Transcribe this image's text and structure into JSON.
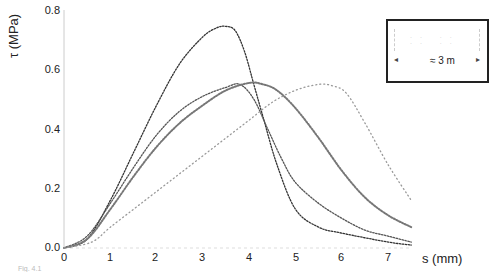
{
  "chart_data": {
    "type": "scatter",
    "title": "",
    "xlabel": "s (mm)",
    "ylabel": "τ (MPa)",
    "xlim": [
      0,
      7.5
    ],
    "ylim": [
      0,
      0.8
    ],
    "x_ticks": [
      "0",
      "1",
      "2",
      "3",
      "4",
      "5",
      "6",
      "7"
    ],
    "y_ticks": [
      "0.0",
      "0.2",
      "0.4",
      "0.6",
      "0.8"
    ],
    "grid": false,
    "legend_position": "inset top-right",
    "inset_label": "≈ 3 m",
    "series": [
      {
        "name": "Curve A (highest peak)",
        "x": [
          0,
          0.5,
          1.0,
          1.5,
          2.0,
          2.5,
          3.0,
          3.3,
          3.5,
          3.7,
          3.9,
          4.1,
          4.3,
          4.6,
          5.0,
          5.5,
          6.0,
          7.0,
          7.5
        ],
        "y": [
          0,
          0.03,
          0.16,
          0.32,
          0.48,
          0.62,
          0.71,
          0.74,
          0.745,
          0.73,
          0.66,
          0.55,
          0.44,
          0.28,
          0.13,
          0.07,
          0.05,
          0.02,
          0.01
        ]
      },
      {
        "name": "Curve B",
        "x": [
          0,
          0.5,
          1.0,
          1.5,
          2.0,
          2.5,
          3.0,
          3.5,
          3.8,
          4.1,
          4.4,
          4.7,
          5.0,
          5.5,
          6.0,
          6.5,
          7.0,
          7.5
        ],
        "y": [
          0,
          0.04,
          0.15,
          0.27,
          0.38,
          0.46,
          0.51,
          0.54,
          0.55,
          0.5,
          0.4,
          0.3,
          0.22,
          0.15,
          0.1,
          0.06,
          0.04,
          0.02
        ]
      },
      {
        "name": "Curve C",
        "x": [
          0,
          0.5,
          1.0,
          1.5,
          2.0,
          2.5,
          3.0,
          3.5,
          4.0,
          4.3,
          4.6,
          5.0,
          5.5,
          6.0,
          6.5,
          7.0,
          7.5
        ],
        "y": [
          0,
          0.03,
          0.13,
          0.24,
          0.34,
          0.42,
          0.48,
          0.53,
          0.555,
          0.55,
          0.53,
          0.47,
          0.37,
          0.26,
          0.17,
          0.11,
          0.07
        ]
      },
      {
        "name": "Curve D (right-shifted)",
        "x": [
          0,
          0.6,
          1.0,
          1.5,
          2.0,
          2.5,
          3.0,
          3.5,
          4.0,
          4.5,
          5.0,
          5.5,
          5.8,
          6.1,
          6.5,
          7.0,
          7.5
        ],
        "y": [
          0,
          0.02,
          0.07,
          0.13,
          0.19,
          0.25,
          0.31,
          0.37,
          0.43,
          0.49,
          0.53,
          0.55,
          0.545,
          0.52,
          0.42,
          0.28,
          0.16
        ]
      }
    ]
  },
  "caption_fragment": "Fig. 4.1"
}
